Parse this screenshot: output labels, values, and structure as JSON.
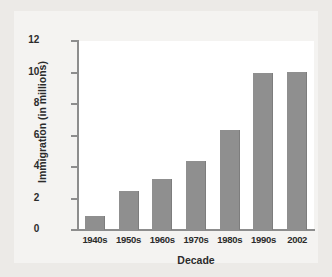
{
  "chart_data": {
    "type": "bar",
    "title": "",
    "xlabel": "Decade",
    "ylabel": "Immigration (in millions)",
    "categories": [
      "1940s",
      "1950s",
      "1960s",
      "1970s",
      "1980s",
      "1990s",
      "2002"
    ],
    "values": [
      0.9,
      2.5,
      3.25,
      4.4,
      6.35,
      10.0,
      10.05
    ],
    "ylim": [
      0,
      12
    ],
    "yticks": [
      0,
      2,
      4,
      6,
      8,
      10,
      12
    ],
    "ytick_labels": [
      "0",
      "2",
      "4",
      "6",
      "8",
      "10",
      "12"
    ],
    "grid": false,
    "legend": null,
    "series": [
      {
        "name": "Immigration",
        "values": [
          0.9,
          2.5,
          3.25,
          4.4,
          6.35,
          10.0,
          10.05
        ]
      }
    ],
    "colors": {
      "bar_fill": "#8f8f8f",
      "bar_edge": "#7d7d7d",
      "axis": "#8d8d8d",
      "text": "#2b2b2b",
      "plot_background": "#ffffff",
      "panel_background": "#f4f3f1",
      "figure_background": "#eceae7"
    }
  }
}
